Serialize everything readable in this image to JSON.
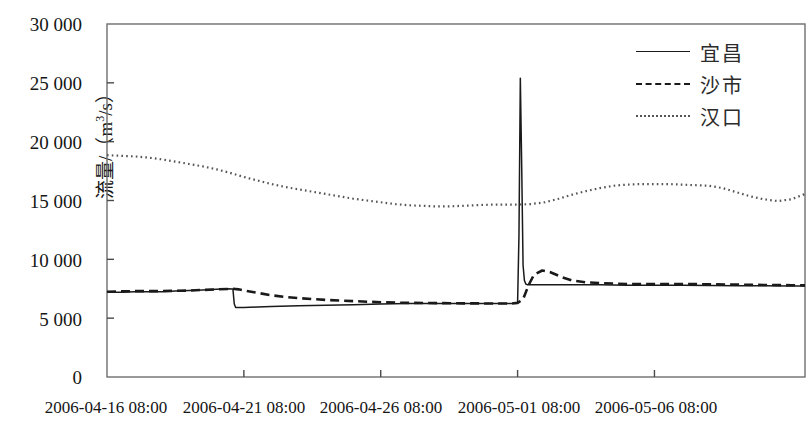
{
  "chart_data": {
    "type": "line",
    "title": "",
    "xlabel": "",
    "ylabel": "流量/（m³/s）",
    "ylabel_text": "流量/（m",
    "ylabel_sup": "3",
    "ylabel_tail": "/s）",
    "ylim": [
      0,
      30000
    ],
    "yticks": [
      0,
      5000,
      10000,
      15000,
      20000,
      25000,
      30000
    ],
    "ytick_labels": [
      "0",
      "5 000",
      "10 000",
      "15 000",
      "20 000",
      "25 000",
      "30 000"
    ],
    "grid": false,
    "legend_position": "top-right",
    "xtick_labels": [
      "2006-04-16 08:00",
      "2006-04-21 08:00",
      "2006-04-26 08:00",
      "2006-05-01 08:00",
      "2006-05-06 08:00"
    ],
    "xtick_positions": [
      0,
      5,
      10,
      15,
      20
    ],
    "xlim": [
      0,
      25.5
    ],
    "x_unit": "days from 2006-04-16 08:00",
    "series": [
      {
        "name": "宜昌",
        "style": "solid",
        "color": "#1a1a1a",
        "x": [
          0,
          0.5,
          1,
          1.5,
          2,
          2.5,
          3,
          3.5,
          4,
          4.4,
          4.6,
          4.65,
          4.7,
          5,
          5.5,
          6,
          7,
          8,
          9,
          10,
          11,
          12,
          13,
          14,
          14.5,
          14.8,
          15.0,
          15.05,
          15.1,
          15.15,
          15.2,
          15.25,
          15.3,
          15.35,
          15.4,
          15.5,
          15.7,
          16,
          17,
          18,
          19,
          20,
          21,
          22,
          23,
          24,
          25,
          25.5
        ],
        "y": [
          7200,
          7200,
          7250,
          7250,
          7250,
          7300,
          7350,
          7400,
          7450,
          7500,
          7480,
          6200,
          5900,
          5900,
          5950,
          6000,
          6050,
          6100,
          6150,
          6200,
          6250,
          6250,
          6250,
          6250,
          6250,
          6250,
          6300,
          12000,
          25400,
          18000,
          9500,
          8200,
          7900,
          7850,
          7850,
          7850,
          7850,
          7850,
          7850,
          7850,
          7800,
          7800,
          7800,
          7780,
          7760,
          7750,
          7740,
          7730
        ]
      },
      {
        "name": "沙市",
        "style": "dashed",
        "color": "#1a1a1a",
        "x": [
          0,
          1,
          2,
          3,
          4,
          4.6,
          4.8,
          5,
          5.5,
          6,
          6.5,
          7,
          8,
          9,
          10,
          11,
          12,
          13,
          14,
          14.8,
          15,
          15.2,
          15.4,
          15.6,
          15.9,
          16.2,
          16.6,
          17,
          17.5,
          18,
          19,
          20,
          21,
          22,
          23,
          24,
          25,
          25.5
        ],
        "y": [
          7250,
          7300,
          7300,
          7350,
          7450,
          7500,
          7450,
          7350,
          7150,
          6950,
          6800,
          6700,
          6550,
          6450,
          6350,
          6300,
          6280,
          6260,
          6250,
          6250,
          6300,
          6600,
          7800,
          8700,
          9050,
          8900,
          8500,
          8200,
          8050,
          7980,
          7900,
          7900,
          7900,
          7880,
          7850,
          7820,
          7800,
          7790
        ]
      },
      {
        "name": "汉口",
        "style": "dotted",
        "color": "#555555",
        "x": [
          0,
          0.5,
          1,
          1.5,
          2,
          2.5,
          3,
          3.5,
          4,
          4.5,
          5,
          5.5,
          6,
          6.5,
          7,
          7.5,
          8,
          8.5,
          9,
          9.5,
          10,
          10.5,
          11,
          11.5,
          12,
          12.5,
          13,
          13.5,
          14,
          14.5,
          15,
          15.5,
          16,
          16.5,
          17,
          17.5,
          18,
          18.5,
          19,
          19.5,
          20,
          20.5,
          21,
          21.5,
          22,
          22.5,
          23,
          23.5,
          24,
          24.5,
          25,
          25.5
        ],
        "y": [
          18850,
          18800,
          18750,
          18650,
          18500,
          18300,
          18100,
          17900,
          17650,
          17350,
          17000,
          16700,
          16400,
          16150,
          15950,
          15750,
          15550,
          15350,
          15150,
          15000,
          14850,
          14700,
          14600,
          14550,
          14500,
          14500,
          14550,
          14600,
          14650,
          14650,
          14650,
          14700,
          14850,
          15150,
          15500,
          15800,
          16050,
          16250,
          16350,
          16400,
          16400,
          16400,
          16350,
          16300,
          16250,
          16050,
          15700,
          15350,
          15100,
          14950,
          15100,
          15550
        ]
      }
    ]
  },
  "legend": {
    "items": [
      {
        "label": "宜昌",
        "style": "solid"
      },
      {
        "label": "沙市",
        "style": "dashed"
      },
      {
        "label": "汉口",
        "style": "dotted"
      }
    ]
  },
  "axes": {
    "plot_left_px": 107,
    "plot_right_px": 805,
    "plot_top_px": 24,
    "plot_bottom_px": 377
  }
}
